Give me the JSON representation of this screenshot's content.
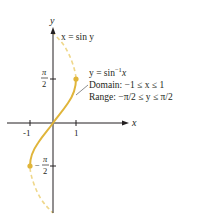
{
  "figure": {
    "axes": {
      "x_label": "x",
      "y_label": "y",
      "x_ticks": [
        {
          "label": "-1",
          "value": -1
        },
        {
          "label": "1",
          "value": 1
        }
      ],
      "y_ticks": [
        {
          "num": "π",
          "den": "2",
          "value": "π/2"
        },
        {
          "num": "π",
          "den": "2",
          "sign": "−",
          "value": "-π/2"
        }
      ]
    },
    "curve_label": "x = sin y",
    "annotation": {
      "line1": "y = sin",
      "line1_sup": "−1",
      "line1_tail": "x",
      "line2": "Domain:  −1 ≤ x ≤ 1",
      "line3": "Range: −π/2 ≤ y ≤ π/2"
    },
    "colors": {
      "solid_curve": "#e0b53a",
      "dashed_curve": "#efd78a",
      "axis": "#231f20",
      "leader": "#6d6e71"
    }
  }
}
